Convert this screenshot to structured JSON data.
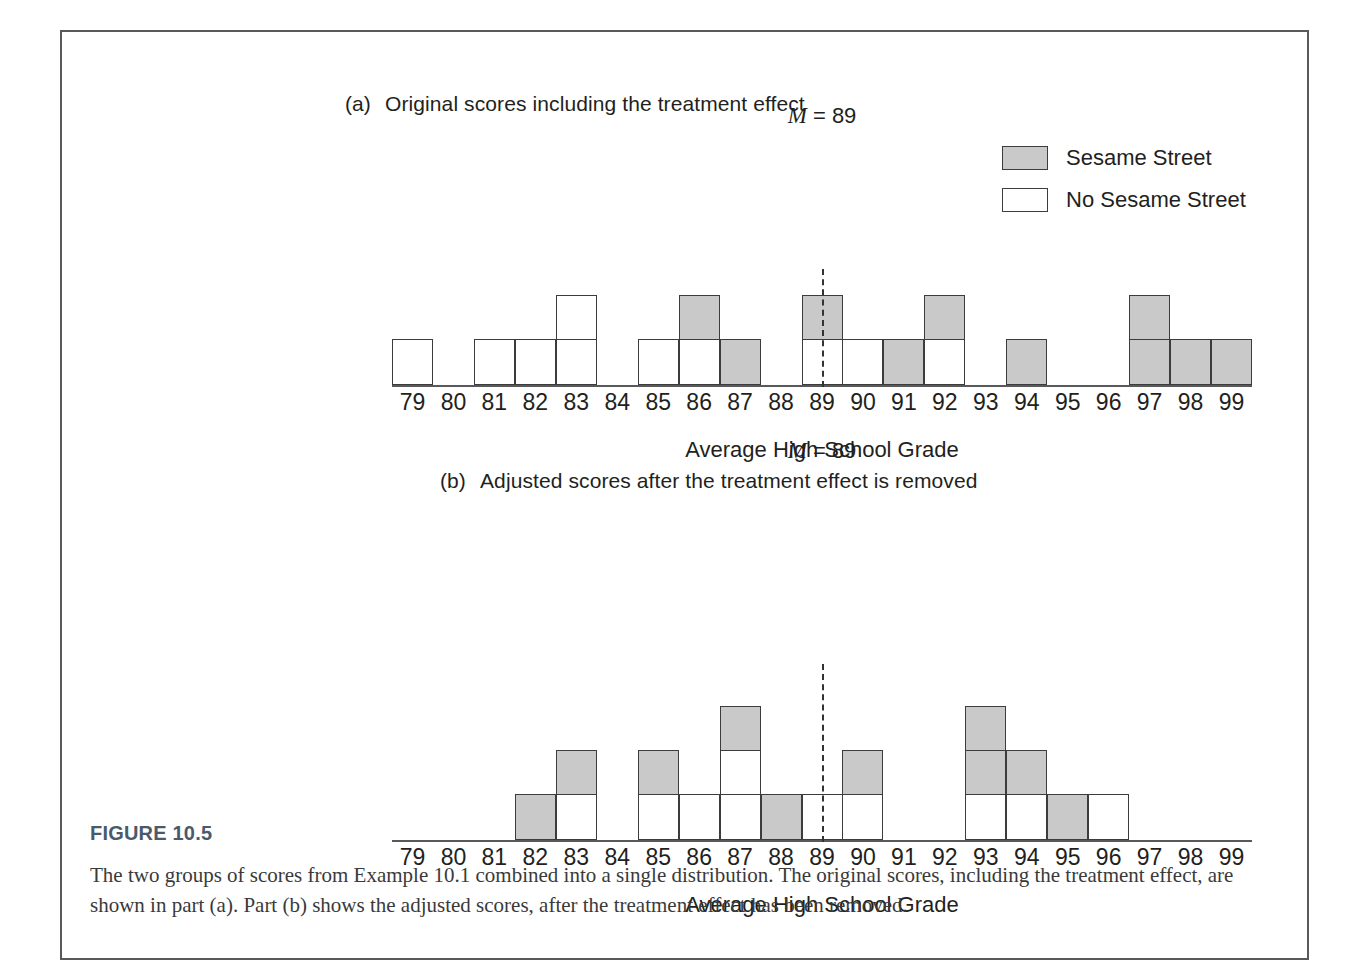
{
  "figure": {
    "number": "FIGURE 10.5",
    "caption": "The two groups of scores from Example 10.1 combined into a single distribution. The original scores, including the treatment effect, are shown in part (a). Part (b) shows the adjusted scores, after the treatment effect has been removed."
  },
  "legend": {
    "items": [
      {
        "label": "Sesame Street",
        "fill": "#c9c9c9",
        "swatch": "filled"
      },
      {
        "label": "No Sesame Street",
        "fill": "#ffffff",
        "swatch": "empty"
      }
    ]
  },
  "panels": {
    "a": {
      "tag": "(a)",
      "title": "Original scores including the treatment effect",
      "mean_label_M": "M",
      "mean_label_rest": " = 89",
      "mean_value": 89,
      "axis_title": "Average High School Grade"
    },
    "b": {
      "tag": "(b)",
      "title": "Adjusted scores after the treatment effect is removed",
      "mean_label_M": "M",
      "mean_label_rest": " = 89",
      "mean_value": 89,
      "axis_title": "Average High School Grade"
    }
  },
  "chart_data": [
    {
      "type": "bar",
      "id": "panel-a",
      "title": "(a)  Original scores including the treatment effect",
      "xlabel": "Average High School Grade",
      "ylabel": "",
      "categories": [
        79,
        80,
        81,
        82,
        83,
        84,
        85,
        86,
        87,
        88,
        89,
        90,
        91,
        92,
        93,
        94,
        95,
        96,
        97,
        98,
        99
      ],
      "series": [
        {
          "name": "No Sesame Street",
          "color": "#ffffff",
          "values": [
            1,
            0,
            1,
            1,
            2,
            0,
            1,
            1,
            0,
            0,
            1,
            1,
            0,
            1,
            0,
            0,
            0,
            0,
            0,
            0,
            0
          ]
        },
        {
          "name": "Sesame Street",
          "color": "#c9c9c9",
          "values": [
            0,
            0,
            0,
            0,
            0,
            0,
            0,
            1,
            1,
            0,
            1,
            0,
            1,
            1,
            0,
            1,
            0,
            0,
            2,
            1,
            1
          ]
        }
      ],
      "stacks": {
        "79": [
          "w"
        ],
        "80": [],
        "81": [
          "w"
        ],
        "82": [
          "w"
        ],
        "83": [
          "w",
          "w"
        ],
        "84": [],
        "85": [
          "w"
        ],
        "86": [
          "w",
          "g"
        ],
        "87": [
          "g"
        ],
        "88": [],
        "89": [
          "w",
          "g"
        ],
        "90": [
          "w"
        ],
        "91": [
          "g"
        ],
        "92": [
          "w",
          "g"
        ],
        "93": [],
        "94": [
          "g"
        ],
        "95": [],
        "96": [],
        "97": [
          "g",
          "g"
        ],
        "98": [
          "g"
        ],
        "99": [
          "g"
        ]
      },
      "totals": [
        1,
        0,
        1,
        1,
        2,
        0,
        1,
        2,
        1,
        0,
        2,
        1,
        1,
        2,
        0,
        1,
        0,
        0,
        2,
        1,
        1
      ],
      "n": 20,
      "ylim": [
        0,
        3
      ],
      "grid": false,
      "annotations": [
        {
          "text": "M = 89",
          "x": 89,
          "type": "mean-line",
          "style": "dashed"
        }
      ],
      "legend_position": "top-right"
    },
    {
      "type": "bar",
      "id": "panel-b",
      "title": "(b)  Adjusted scores after the treatment effect is removed",
      "xlabel": "Average High School Grade",
      "ylabel": "",
      "categories": [
        79,
        80,
        81,
        82,
        83,
        84,
        85,
        86,
        87,
        88,
        89,
        90,
        91,
        92,
        93,
        94,
        95,
        96,
        97,
        98,
        99
      ],
      "series": [
        {
          "name": "No Sesame Street",
          "color": "#ffffff",
          "values": [
            0,
            0,
            0,
            0,
            1,
            0,
            1,
            1,
            2,
            0,
            1,
            1,
            0,
            0,
            1,
            1,
            0,
            1,
            0,
            0,
            0
          ]
        },
        {
          "name": "Sesame Street",
          "color": "#c9c9c9",
          "values": [
            0,
            0,
            0,
            1,
            1,
            0,
            1,
            0,
            1,
            1,
            0,
            1,
            0,
            0,
            2,
            1,
            1,
            0,
            0,
            0,
            0
          ]
        }
      ],
      "stacks": {
        "79": [],
        "80": [],
        "81": [],
        "82": [
          "g"
        ],
        "83": [
          "w",
          "g"
        ],
        "84": [],
        "85": [
          "w",
          "g"
        ],
        "86": [
          "w"
        ],
        "87": [
          "w",
          "w",
          "g"
        ],
        "88": [
          "g"
        ],
        "89": [
          "w"
        ],
        "90": [
          "w",
          "g"
        ],
        "91": [],
        "92": [],
        "93": [
          "w",
          "g",
          "g"
        ],
        "94": [
          "w",
          "g"
        ],
        "95": [
          "g"
        ],
        "96": [
          "w"
        ],
        "97": [],
        "98": [],
        "99": []
      },
      "totals": [
        0,
        0,
        0,
        1,
        2,
        0,
        2,
        1,
        3,
        1,
        1,
        2,
        0,
        0,
        3,
        2,
        1,
        1,
        0,
        0,
        0
      ],
      "n": 20,
      "ylim": [
        0,
        3
      ],
      "grid": false,
      "annotations": [
        {
          "text": "M = 89",
          "x": 89,
          "type": "mean-line",
          "style": "dashed"
        }
      ],
      "legend_position": "none"
    }
  ]
}
